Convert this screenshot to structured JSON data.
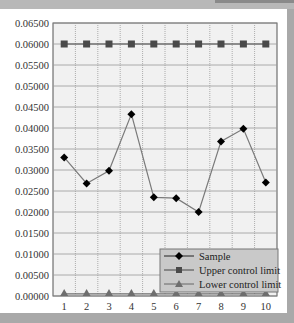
{
  "chart_data": {
    "type": "line",
    "title": "",
    "xlabel": "",
    "ylabel": "",
    "x": [
      1,
      2,
      3,
      4,
      5,
      6,
      7,
      8,
      9,
      10
    ],
    "ylim": [
      0,
      0.065
    ],
    "yticks": [
      "0.00000",
      "0.00500",
      "0.01000",
      "0.01500",
      "0.02000",
      "0.02500",
      "0.03000",
      "0.03500",
      "0.04000",
      "0.04500",
      "0.05000",
      "0.05500",
      "0.06000",
      "0.06500"
    ],
    "xticks": [
      "1",
      "2",
      "3",
      "4",
      "5",
      "6",
      "7",
      "8",
      "9",
      "10"
    ],
    "grid": true,
    "legend_position": "lower right",
    "series": [
      {
        "name": "Sample",
        "marker": "diamond",
        "color": "#000000",
        "line_color": "#7a7a7a",
        "values": [
          0.033,
          0.0268,
          0.0298,
          0.0433,
          0.0235,
          0.0233,
          0.02,
          0.0368,
          0.0398,
          0.027
        ]
      },
      {
        "name": "Upper control limit",
        "marker": "square",
        "color": "#4a4a4a",
        "line_color": "#4a4a4a",
        "values": [
          0.06,
          0.06,
          0.06,
          0.06,
          0.06,
          0.06,
          0.06,
          0.06,
          0.06,
          0.06
        ]
      },
      {
        "name": "Lower control limit",
        "marker": "triangle",
        "color": "#6e6e6e",
        "line_color": "#6e6e6e",
        "values": [
          0.0005,
          0.0005,
          0.0005,
          0.0005,
          0.0005,
          0.0005,
          0.0005,
          0.0005,
          0.0005,
          0.0005
        ]
      }
    ]
  },
  "legend": {
    "items": [
      "Sample",
      "Upper control limit",
      "Lower control limit"
    ]
  }
}
